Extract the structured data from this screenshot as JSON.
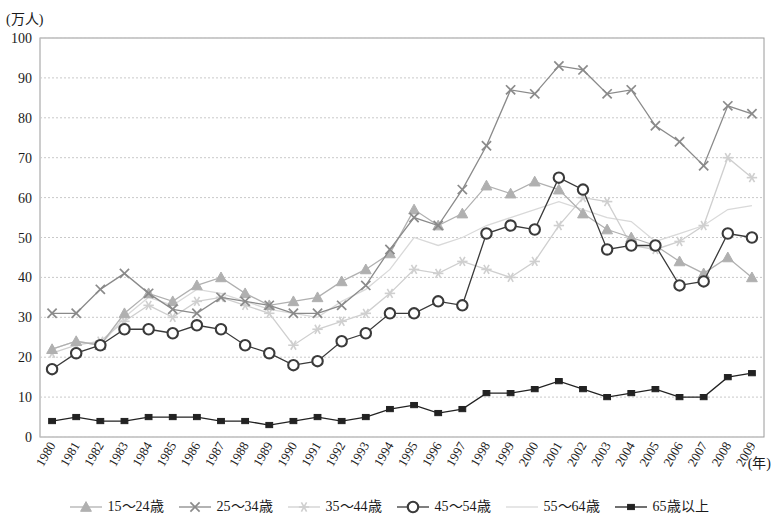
{
  "chart_data": {
    "type": "line",
    "title": "",
    "ylabel": "(万人)",
    "xlabel": "(年)",
    "ylim": [
      0,
      100
    ],
    "ytick_step": 10,
    "yticks": [
      "0",
      "10",
      "20",
      "30",
      "40",
      "50",
      "60",
      "70",
      "80",
      "90",
      "100"
    ],
    "grid": true,
    "legend_position": "bottom",
    "categories": [
      "1980",
      "1981",
      "1982",
      "1983",
      "1984",
      "1985",
      "1986",
      "1987",
      "1988",
      "1989",
      "1990",
      "1991",
      "1992",
      "1993",
      "1994",
      "1995",
      "1996",
      "1997",
      "1998",
      "1999",
      "2000",
      "2001",
      "2002",
      "2003",
      "2004",
      "2005",
      "2006",
      "2007",
      "2008",
      "2009"
    ],
    "series": [
      {
        "name": "15～24歳",
        "marker": "triangle",
        "color": "#b0b0b0",
        "values": [
          22,
          24,
          23,
          31,
          36,
          34,
          38,
          40,
          36,
          33,
          34,
          35,
          39,
          42,
          46,
          57,
          53,
          56,
          63,
          61,
          64,
          62,
          56,
          52,
          50,
          48,
          44,
          41,
          45,
          40
        ]
      },
      {
        "name": "25～34歳",
        "marker": "x",
        "color": "#8a8a8a",
        "values": [
          31,
          31,
          37,
          41,
          36,
          32,
          31,
          35,
          34,
          33,
          31,
          31,
          33,
          38,
          47,
          55,
          53,
          62,
          73,
          87,
          86,
          93,
          92,
          86,
          87,
          78,
          74,
          68,
          83,
          81
        ]
      },
      {
        "name": "35～44歳",
        "marker": "asterisk",
        "color": "#cfcfcf",
        "values": [
          21,
          23,
          24,
          29,
          33,
          30,
          34,
          35,
          33,
          31,
          23,
          27,
          29,
          31,
          36,
          42,
          41,
          44,
          42,
          40,
          44,
          53,
          60,
          59,
          48,
          47,
          49,
          53,
          70,
          65
        ]
      },
      {
        "name": "45～54歳",
        "marker": "circle",
        "color": "#3a3a3a",
        "values": [
          17,
          21,
          23,
          27,
          27,
          26,
          28,
          27,
          23,
          21,
          18,
          19,
          24,
          26,
          31,
          31,
          34,
          33,
          51,
          53,
          52,
          65,
          62,
          47,
          48,
          48,
          38,
          39,
          51,
          50
        ]
      },
      {
        "name": "55～64歳",
        "marker": "none",
        "color": "#d9d9d9",
        "values": [
          22,
          24,
          23,
          30,
          35,
          33,
          37,
          36,
          34,
          32,
          31,
          30,
          34,
          37,
          42,
          50,
          48,
          50,
          53,
          55,
          57,
          59,
          57,
          55,
          54,
          49,
          51,
          53,
          57,
          58
        ]
      },
      {
        "name": "65歳以上",
        "marker": "square",
        "color": "#222222",
        "values": [
          4,
          5,
          4,
          4,
          5,
          5,
          5,
          4,
          4,
          3,
          4,
          5,
          4,
          5,
          7,
          8,
          6,
          7,
          11,
          11,
          12,
          14,
          12,
          10,
          11,
          12,
          10,
          10,
          15,
          16
        ]
      }
    ]
  },
  "legend": {
    "items": [
      {
        "label": "15～24歳",
        "marker": "triangle",
        "color": "#b0b0b0"
      },
      {
        "label": "25～34歳",
        "marker": "x",
        "color": "#8a8a8a"
      },
      {
        "label": "35～44歳",
        "marker": "asterisk",
        "color": "#cfcfcf"
      },
      {
        "label": "45～54歳",
        "marker": "circle",
        "color": "#3a3a3a"
      },
      {
        "label": "55～64歳",
        "marker": "none",
        "color": "#d9d9d9"
      },
      {
        "label": "65歳以上",
        "marker": "square",
        "color": "#222222"
      }
    ]
  }
}
